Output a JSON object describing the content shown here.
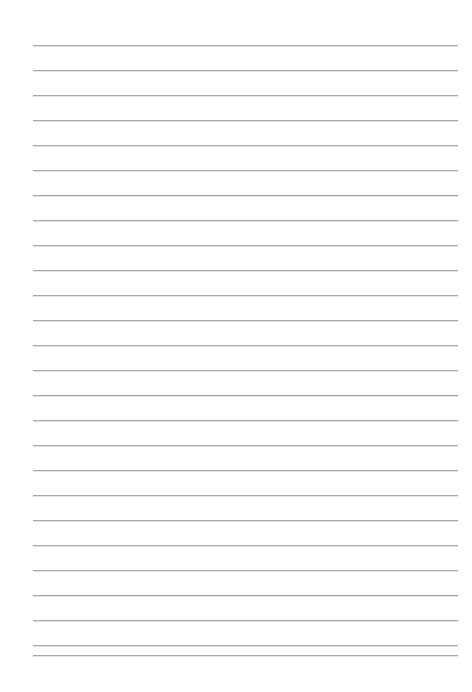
{
  "document": {
    "type": "lined-paper",
    "title": "Blank Ruled Paper",
    "page_width": 472,
    "page_height": 692,
    "background_color": "#ffffff",
    "text_content": ""
  },
  "ruled_lines": {
    "count": 26,
    "color": "#a3a3a3",
    "thickness_px": 1,
    "spacing_px": 25,
    "first_line_y": 45,
    "last_line_y": 655,
    "line_start_x": 33,
    "line_end_x": 458,
    "line_length_px": 425,
    "y_positions": [
      45,
      70,
      95,
      120,
      145,
      170,
      195,
      220,
      245,
      270,
      295,
      320,
      345,
      370,
      395,
      420,
      445,
      470,
      495,
      520,
      545,
      570,
      595,
      620,
      645,
      655
    ]
  },
  "margins": {
    "left_px": 33,
    "right_px": 14,
    "top_px": 45,
    "bottom_px": 37
  }
}
